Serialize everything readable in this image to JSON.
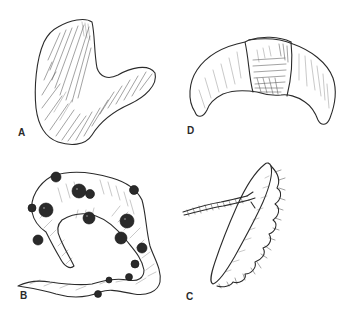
{
  "figure": {
    "panels": [
      {
        "id": "A",
        "label": "A",
        "description": "Smooth hooked (kidney-like) organ with fine striated shading"
      },
      {
        "id": "B",
        "label": "B",
        "description": "Looped tubular structure covered with dark nodules, tapering tail"
      },
      {
        "id": "C",
        "label": "C",
        "description": "Curved crescent organ with a darker central constricting band"
      },
      {
        "id": "D",
        "label": "D",
        "description": "Oblong elongated structure with frilled/ruffled edge and a twisted cord attached"
      }
    ]
  },
  "colors": {
    "background": "#ffffff",
    "ink": "#2b2b2b",
    "nodule": "#2a2a2a"
  }
}
